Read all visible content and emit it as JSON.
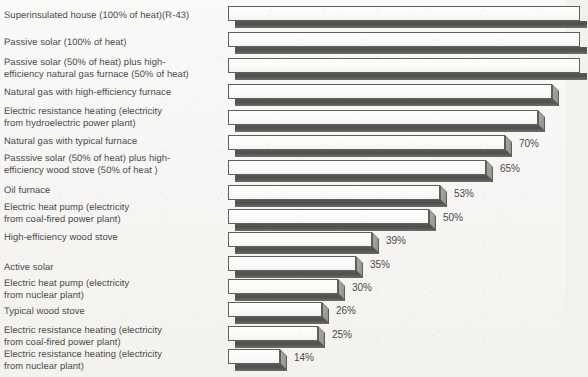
{
  "chart_data": {
    "type": "bar",
    "orientation": "horizontal",
    "title": "",
    "subtitle": "",
    "xlabel": "",
    "ylabel": "",
    "xlim": [
      0,
      100
    ],
    "grid": false,
    "legend": null,
    "units": "percent",
    "axis_visible": false,
    "note": "Top five bars extend beyond the right edge of the image and are clipped; their percentage labels are not visible.",
    "categories": [
      "Superinsulated house (100% of heat)(R-43)",
      "Passive solar (100% of heat)",
      "Passive solar (50% of heat) plus high-\nefficiency natural gas furnace (50% of heat)",
      "Natural gas with high-efficiency furnace",
      "Electric resistance heating (electricity\nfrom hydroelectric power plant)",
      "Natural gas with typical furnace",
      "Passsive solar (50% of heat) plus high-\nefficiency wood stove (50% of heat )",
      "Oil furnace",
      "Electric heat pump (electricity\nfrom coal-fired power plant)",
      "High-efficiency wood stove",
      "Active solar",
      "Electric heat pump (electricity\nfrom nuclear plant)",
      "Typical wood stove",
      "Electric resistance heating (electricity\nfrom coal-fired power plant)",
      "Electric resistance heating (electricity\nfrom nuclear plant)"
    ],
    "values": [
      98,
      90,
      85,
      84,
      82,
      70,
      65,
      53,
      50,
      39,
      35,
      30,
      26,
      25,
      14
    ],
    "data_labels": [
      "",
      "",
      "",
      "",
      "",
      "70%",
      "65%",
      "53%",
      "50%",
      "39%",
      "35%",
      "30%",
      "26%",
      "25%",
      "14%"
    ]
  },
  "rows": [
    {
      "label": "Superinsulated house (100% of heat)(R-43)",
      "value": 98,
      "value_label": "",
      "label_top": 9,
      "bar_top": 6,
      "bar_px": 340,
      "clipped": true
    },
    {
      "label": "Passive solar (100% of heat)",
      "value": 90,
      "value_label": "",
      "label_top": 36,
      "bar_top": 32,
      "bar_px": 340,
      "clipped": true
    },
    {
      "label": "Passive solar (50% of heat) plus high-\nefficiency natural gas furnace (50% of heat)",
      "value": 85,
      "value_label": "",
      "label_top": 56,
      "bar_top": 58,
      "bar_px": 340,
      "clipped": true
    },
    {
      "label": "Natural gas with high-efficiency furnace",
      "value": 84,
      "value_label": "",
      "label_top": 86,
      "bar_top": 84,
      "bar_px": 324,
      "clipped": false
    },
    {
      "label": "Electric resistance heating (electricity\nfrom hydroelectric power plant)",
      "value": 82,
      "value_label": "",
      "label_top": 105,
      "bar_top": 110,
      "bar_px": 310,
      "clipped": false
    },
    {
      "label": "Natural gas with typical furnace",
      "value": 70,
      "value_label": "70%",
      "label_top": 135,
      "bar_top": 135,
      "bar_px": 277,
      "clipped": false
    },
    {
      "label": "Passsive solar (50% of heat) plus high-\nefficiency wood stove (50% of heat )",
      "value": 65,
      "value_label": "65%",
      "label_top": 152,
      "bar_top": 160,
      "bar_px": 258,
      "clipped": false
    },
    {
      "label": "Oil furnace",
      "value": 53,
      "value_label": "53%",
      "label_top": 184,
      "bar_top": 185,
      "bar_px": 212,
      "clipped": false
    },
    {
      "label": "Electric heat pump (electricity\nfrom coal-fired power plant)",
      "value": 50,
      "value_label": "50%",
      "label_top": 201,
      "bar_top": 209,
      "bar_px": 201,
      "clipped": false
    },
    {
      "label": "High-efficiency wood stove",
      "value": 39,
      "value_label": "39%",
      "label_top": 231,
      "bar_top": 232,
      "bar_px": 144,
      "clipped": false
    },
    {
      "label": "Active solar",
      "value": 35,
      "value_label": "35%",
      "label_top": 261,
      "bar_top": 256,
      "bar_px": 128,
      "clipped": false
    },
    {
      "label": "Electric heat pump (electricity\nfrom nuclear plant)",
      "value": 30,
      "value_label": "30%",
      "label_top": 277,
      "bar_top": 279,
      "bar_px": 110,
      "clipped": false
    },
    {
      "label": "Typical wood stove",
      "value": 26,
      "value_label": "26%",
      "label_top": 305,
      "bar_top": 302,
      "bar_px": 94,
      "clipped": false
    },
    {
      "label": "Electric resistance heating (electricity\nfrom coal-fired power plant)",
      "value": 25,
      "value_label": "25%",
      "label_top": 324,
      "bar_top": 326,
      "bar_px": 90,
      "clipped": false
    },
    {
      "label": "Electric resistance heating (electricity\nfrom nuclear plant)",
      "value": 14,
      "value_label": "14%",
      "label_top": 348,
      "bar_top": 349,
      "bar_px": 52,
      "clipped": false
    }
  ],
  "geometry": {
    "bar_origin_x": 228,
    "label_left": 4,
    "canvas_width": 566,
    "canvas_height": 377
  },
  "colors": {
    "background": "#f3f2ef",
    "text": "#4a4a4a",
    "bar_front": "#fbfbfa",
    "bar_outline": "#5f5f5d",
    "bar_shadow": "#4f4f4d",
    "bar_cap": "#9a9a97"
  }
}
